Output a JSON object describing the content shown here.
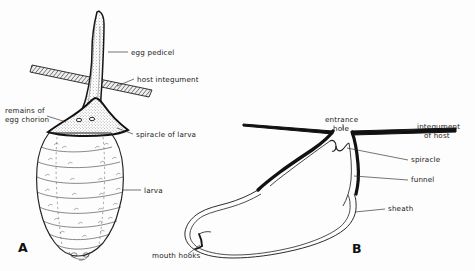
{
  "figure": {
    "background_color": "#fdfdfd",
    "ink_color": "#1a1a1a",
    "panels": [
      {
        "id": "A",
        "letter": "A"
      },
      {
        "id": "B",
        "letter": "B"
      }
    ]
  },
  "panel_a": {
    "letter": "A",
    "labels": {
      "egg_pedicel": "egg pedicel",
      "host_integument": "host integument",
      "remains_of_egg_chorion_line1": "remains of",
      "remains_of_egg_chorion_line2": "egg chorion",
      "spiracle_of_larva": "spiracle of larva",
      "larva": "larva"
    }
  },
  "panel_b": {
    "letter": "B",
    "labels": {
      "entrance_hole_line1": "entrance",
      "entrance_hole_line2": "hole",
      "integument_of_host_line1": "integument",
      "integument_of_host_line2": "of host",
      "spiracle": "spiracle",
      "funnel": "funnel",
      "sheath": "sheath",
      "mouth_hooks": "mouth hooks"
    }
  }
}
